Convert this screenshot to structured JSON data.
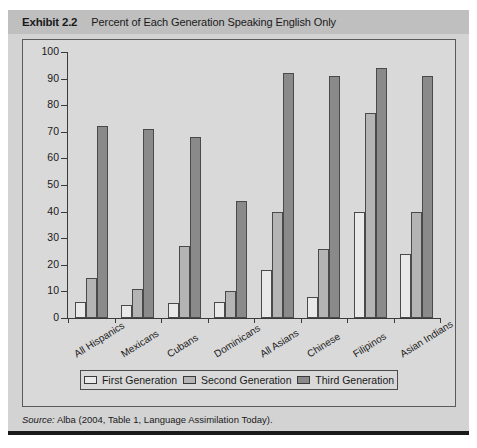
{
  "exhibit": {
    "label": "Exhibit 2.2",
    "title": "Percent of Each Generation Speaking English Only",
    "source_prefix": "Source:",
    "source_text": "Alba (2004, Table 1, Language Assimilation Today)."
  },
  "chart_data": {
    "type": "bar",
    "title": "Percent of Each Generation Speaking English Only",
    "xlabel": "",
    "ylabel": "",
    "ylim": [
      0,
      100
    ],
    "yticks": [
      0,
      10,
      20,
      30,
      40,
      50,
      60,
      70,
      80,
      90,
      100
    ],
    "grid": false,
    "legend_position": "bottom",
    "categories": [
      "All Hispanics",
      "Mexicans",
      "Cubans",
      "Dominicans",
      "All Asians",
      "Chinese",
      "Filipinos",
      "Asian Indians"
    ],
    "series": [
      {
        "name": "First Generation",
        "color": "#e9e9e9",
        "values": [
          6,
          5,
          5.5,
          6,
          18,
          8,
          40,
          24
        ]
      },
      {
        "name": "Second Generation",
        "color": "#b4b4b4",
        "values": [
          15,
          11,
          27,
          10,
          40,
          26,
          77,
          40
        ]
      },
      {
        "name": "Third Generation",
        "color": "#8a8a8a",
        "values": [
          72,
          71,
          68,
          44,
          92,
          91,
          94,
          91
        ]
      }
    ]
  }
}
